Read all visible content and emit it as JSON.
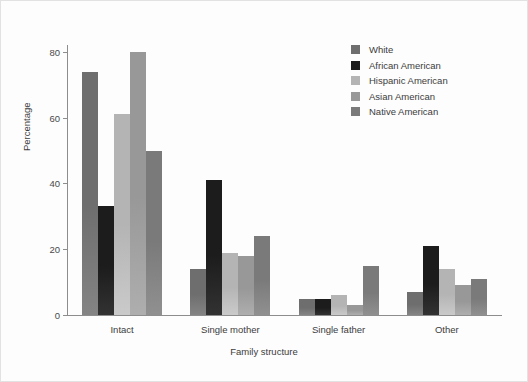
{
  "chart_data": {
    "type": "bar",
    "title": "",
    "xlabel": "Family structure",
    "ylabel": "Percentage",
    "categories": [
      "Intact",
      "Single mother",
      "Single father",
      "Other"
    ],
    "series": [
      {
        "name": "White",
        "color": "#6e6e6e",
        "values": [
          74,
          14,
          5,
          7
        ]
      },
      {
        "name": "African American",
        "color": "#1c1c1c",
        "values": [
          33,
          41,
          5,
          21
        ]
      },
      {
        "name": "Hispanic American",
        "color": "#b4b4b4",
        "values": [
          61,
          19,
          6,
          14
        ]
      },
      {
        "name": "Asian American",
        "color": "#989898",
        "values": [
          80,
          18,
          3,
          9
        ]
      },
      {
        "name": "Native American",
        "color": "#7a7a7a",
        "values": [
          50,
          24,
          15,
          11
        ]
      }
    ],
    "ylim": [
      0,
      83.3
    ],
    "yticks": [
      0,
      20,
      40,
      60,
      80
    ],
    "ytick_labels": [
      "0",
      "20",
      "40",
      "60",
      "80"
    ],
    "grid": false,
    "legend_position": "upper right",
    "legend_entries": [
      "White",
      "African American",
      "Hispanic American",
      "Asian American",
      "Native American"
    ]
  }
}
